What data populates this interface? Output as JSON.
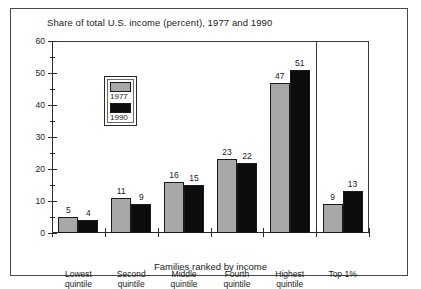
{
  "figure": {
    "title": "Share of total U.S. income (percent), 1977 and 1990"
  },
  "legend": {
    "entries": [
      {
        "label": "1977",
        "swatch": "gray-swatch",
        "color": "#a8a8a8"
      },
      {
        "label": "1990",
        "swatch": "black-swatch",
        "color": "#0d0d0d"
      }
    ]
  },
  "axes": {
    "y_ticks": [
      "0",
      "10",
      "20",
      "30",
      "40",
      "50",
      "60"
    ],
    "x_title": "Families ranked by income"
  },
  "chart_data": {
    "type": "bar",
    "title": "Share of total U.S. income (percent), 1977 and 1990",
    "xlabel": "Families ranked by income",
    "ylabel": "",
    "ylim": [
      0,
      60
    ],
    "ytick_step": 10,
    "yminor_step": 5,
    "grid": false,
    "legend_position": "inside-top-left",
    "categories": [
      "Lowest quintile",
      "Second quintile",
      "Middle quintile",
      "Fourth quintile",
      "Highest quintile",
      "Top 1%"
    ],
    "category_lines": [
      [
        "Lowest",
        "quintile"
      ],
      [
        "Second",
        "quintile"
      ],
      [
        "Middle",
        "quintile"
      ],
      [
        "Fourth",
        "quintile"
      ],
      [
        "Highest",
        "quintile"
      ],
      [
        "Top 1%",
        ""
      ]
    ],
    "series": [
      {
        "name": "1977",
        "color": "#a8a8a8",
        "values": [
          5,
          11,
          16,
          23,
          47,
          9
        ]
      },
      {
        "name": "1990",
        "color": "#0d0d0d",
        "values": [
          4,
          9,
          15,
          22,
          51,
          13
        ]
      }
    ],
    "annotations": [
      "Vertical separator line drawn between the Highest quintile group and the Top 1% group"
    ]
  }
}
